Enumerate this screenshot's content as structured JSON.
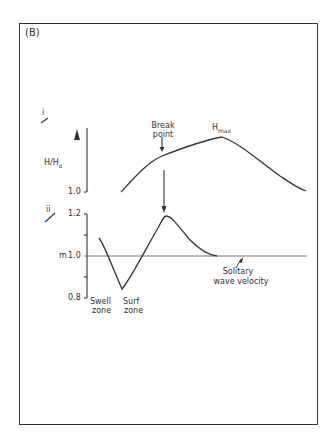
{
  "figure": {
    "panel_label": "(B)",
    "subplot_i": {
      "label": "i",
      "ylabel": "H/H",
      "ylabel_sub": "o",
      "y_tick": "1.0",
      "break_point_label_line1": "Break",
      "break_point_label_line2": "point",
      "hmax_label": "H",
      "hmax_sub": "max"
    },
    "subplot_ii": {
      "label": "ii",
      "ylabel": "m",
      "y_ticks": [
        "1.2",
        "1.0",
        "0.8"
      ],
      "zone_labels": {
        "swell_line1": "Swell",
        "swell_line2": "zone",
        "surf_line1": "Surf",
        "surf_line2": "zone"
      },
      "reference_line_label_line1": "Solitary",
      "reference_line_label_line2": "wave velocity"
    },
    "colors": {
      "ink": "#333333",
      "background": "#ffffff"
    }
  }
}
